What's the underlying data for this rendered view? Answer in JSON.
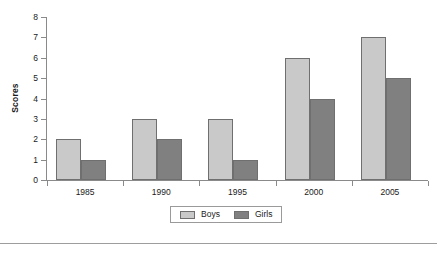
{
  "chart_data": {
    "type": "bar",
    "title": "",
    "xlabel": "",
    "ylabel": "Scores",
    "categories": [
      "1985",
      "1990",
      "1995",
      "2000",
      "2005"
    ],
    "series": [
      {
        "name": "Boys",
        "color": "#c9c9c9",
        "values": [
          2,
          3,
          3,
          6,
          7
        ]
      },
      {
        "name": "Girls",
        "color": "#808080",
        "values": [
          1,
          2,
          1,
          4,
          5
        ]
      }
    ],
    "ylim": [
      0,
      8
    ],
    "ytick_step": 1,
    "yticks": [
      "0",
      "1",
      "2",
      "3",
      "4",
      "5",
      "6",
      "7",
      "8"
    ],
    "grid": false,
    "legend_position": "bottom-center"
  },
  "legend": {
    "items": [
      {
        "label": "Boys"
      },
      {
        "label": "Girls"
      }
    ]
  },
  "axes": {
    "y_title": "Scores"
  }
}
